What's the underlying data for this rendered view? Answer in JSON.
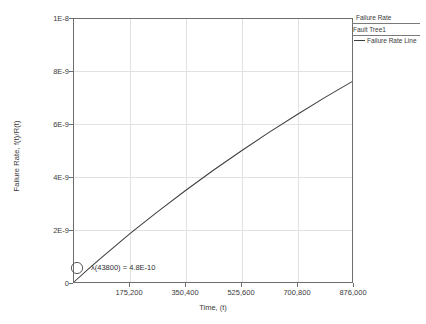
{
  "chart_data": {
    "type": "line",
    "title": "",
    "xlabel": "Time, (t)",
    "ylabel": "Failure Rate, f(t)/R(t)",
    "xlim": [
      0,
      876000
    ],
    "ylim": [
      0,
      1e-08
    ],
    "grid": true,
    "xticks": [
      "175,200",
      "350,400",
      "525,600",
      "700,800",
      "876,000"
    ],
    "xtick_values": [
      175200,
      350400,
      525600,
      700800,
      876000
    ],
    "yticks": [
      "0",
      "2E-9",
      "4E-9",
      "6E-9",
      "8E-9",
      "1E-8"
    ],
    "ytick_values": [
      0,
      2e-09,
      4e-09,
      6e-09,
      8e-09,
      1e-08
    ],
    "series": [
      {
        "name": "Failure Rate Line",
        "color": "#3c3c3c",
        "x": [
          0,
          43800,
          87600,
          175200,
          262800,
          350400,
          438000,
          525600,
          613200,
          700800,
          788400,
          876000
        ],
        "y": [
          0,
          4.8e-10,
          9.4e-10,
          1.83e-09,
          2.67e-09,
          3.47e-09,
          4.24e-09,
          4.97e-09,
          5.68e-09,
          6.35e-09,
          7e-09,
          7.62e-09
        ]
      }
    ],
    "annotations": [
      {
        "text": "λ(43800) = 4.8E-10",
        "marker": "circle-with-slash",
        "x": 43800,
        "y": 4.8e-10
      }
    ],
    "legend": {
      "position": "top-right",
      "title": "Failure Rate",
      "series_group": "Fault Tree1",
      "entries": [
        {
          "label": "Failure Rate Line",
          "color": "#3c3c3c"
        }
      ]
    }
  }
}
